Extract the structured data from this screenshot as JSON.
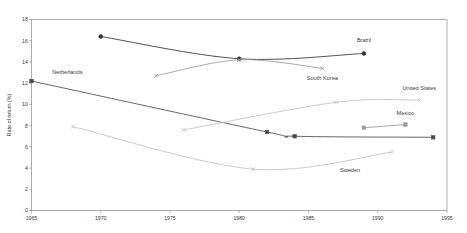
{
  "chart_data": {
    "type": "line",
    "title": "",
    "xlabel": "",
    "ylabel": "Rate of return (%)",
    "xlim": [
      1965,
      1995
    ],
    "ylim": [
      0,
      18
    ],
    "xticks": [
      1965,
      1970,
      1975,
      1980,
      1985,
      1990,
      1995
    ],
    "yticks": [
      0,
      2,
      4,
      6,
      8,
      10,
      12,
      14,
      16,
      18
    ],
    "grid": false,
    "legend": "inline-labels",
    "series": [
      {
        "name": "Brazil",
        "color": "#333333",
        "marker": "filled-circle",
        "label_x": 1989,
        "label_y": 15.9,
        "label_anchor": "middle",
        "x": [
          1970,
          1980,
          1989
        ],
        "y": [
          16.4,
          14.3,
          14.8
        ]
      },
      {
        "name": "South Korea",
        "color": "#9a9a9a",
        "marker": "cross",
        "label_x": 1986,
        "label_y": 12.3,
        "label_anchor": "middle",
        "x": [
          1974,
          1980,
          1986
        ],
        "y": [
          12.7,
          14.2,
          13.4
        ]
      },
      {
        "name": "Netherlands",
        "color": "#4a4a4a",
        "marker": "filled-square",
        "label_x": 1966.5,
        "label_y": 12.9,
        "label_anchor": "start",
        "x": [
          1965,
          1982,
          1984,
          1994
        ],
        "y": [
          12.2,
          7.4,
          7.0,
          6.9
        ]
      },
      {
        "name": "United States",
        "color": "#c2c2c2",
        "marker": "cross",
        "label_x": 1993,
        "label_y": 11.4,
        "label_anchor": "middle",
        "x": [
          1976,
          1987,
          1993
        ],
        "y": [
          7.6,
          10.2,
          10.4
        ]
      },
      {
        "name": "Mexico",
        "color": "#9a9a9a",
        "marker": "filled-square",
        "label_x": 1992,
        "label_y": 9.0,
        "label_anchor": "middle",
        "x": [
          1989,
          1992
        ],
        "y": [
          7.8,
          8.1
        ]
      },
      {
        "name": "Sweden",
        "color": "#c2c2c2",
        "marker": "cross",
        "label_x": 1988,
        "label_y": 3.6,
        "label_anchor": "middle",
        "x": [
          1968,
          1981,
          1991
        ],
        "y": [
          7.9,
          3.9,
          5.5
        ]
      }
    ]
  }
}
